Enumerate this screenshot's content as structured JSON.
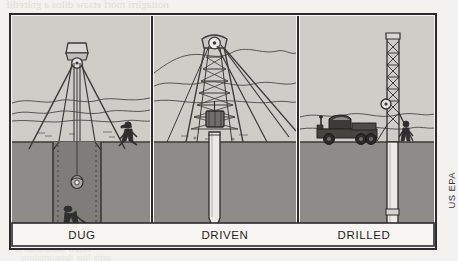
{
  "figure": {
    "source_credit": "US EPA",
    "panels": [
      {
        "id": "dug",
        "caption": "DUG",
        "elements": {
          "derrick": "tripod-derrick",
          "pulley": "pulley-wheel",
          "rope": "hoist-rope",
          "bucket": "bucket",
          "worker_surface": "worker-standing",
          "worker_pit": "worker-digging",
          "shaft": "lined-well-shaft"
        }
      },
      {
        "id": "driven",
        "caption": "DRIVEN",
        "elements": {
          "derrick": "lattice-derrick",
          "crown_pulley": "crown-pulley",
          "drive_weight": "drive-weight",
          "guy_wires": "guy-wires",
          "pipe": "driven-pipe-with-point"
        }
      },
      {
        "id": "drilled",
        "caption": "DRILLED",
        "elements": {
          "rig": "drill-rig-truck",
          "mast": "drill-mast",
          "pulley": "mast-pulley",
          "worker": "worker-standing",
          "casing": "well-casing"
        }
      }
    ],
    "scene": {
      "sky_label": "sky",
      "ground_label": "ground-subsurface",
      "horizon_label": "hills-horizon"
    }
  },
  "colors": {
    "page_background": "#f3f2ee",
    "figure_border": "#2b2b2b",
    "sky": "#cfcdc8",
    "ground": "#8d8c88",
    "ink": "#3a3a3a",
    "caption_background": "#f7f6f3",
    "caption_text": "#1e1e1e",
    "pipe_fill": "#ebeae6",
    "bleed_text": "#ddd9d2"
  },
  "bleedthrough": {
    "line1": "noitagirri morf etsaw dilos a gniretlif",
    "line2": "eht ot snoitagitsevni",
    "line3": "lliw setis esehT",
    "line4": "TROPER YRANIMILERP",
    "line5": "YTILIBISAEF SUTATS",
    "line6": "etsaw suodrazah fo",
    "line7": "setis lios detanimatnoc"
  }
}
